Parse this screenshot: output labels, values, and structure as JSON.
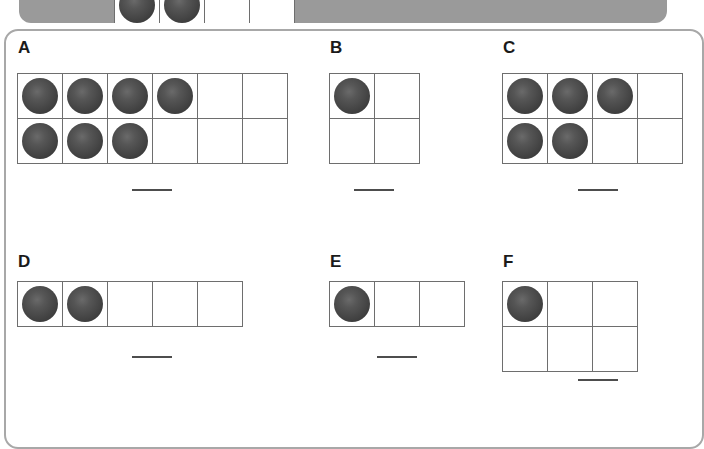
{
  "worksheet": {
    "title": "Counting Counters Worksheet",
    "counter_color": "#4a4a4a",
    "grid_line_color": "#6e6e6e",
    "panel_border_color": "#a8a8a8",
    "top_panel_color": "#9a9a9a"
  },
  "top_panel": {
    "label": "previous-question-strip",
    "grid": {
      "columns": 4,
      "rows": 1,
      "filled": 2
    }
  },
  "problems": [
    {
      "letter": "A",
      "columns": 6,
      "rows": 2,
      "cell_size": 45,
      "counts": [
        4,
        3
      ],
      "total_counters": 7,
      "answer": ""
    },
    {
      "letter": "B",
      "columns": 2,
      "rows": 2,
      "cell_size": 45,
      "counts": [
        1,
        0
      ],
      "total_counters": 1,
      "answer": ""
    },
    {
      "letter": "C",
      "columns": 4,
      "rows": 2,
      "cell_size": 45,
      "counts": [
        3,
        2
      ],
      "total_counters": 5,
      "answer": ""
    },
    {
      "letter": "D",
      "columns": 5,
      "rows": 1,
      "cell_size": 45,
      "counts": [
        2
      ],
      "total_counters": 2,
      "answer": ""
    },
    {
      "letter": "E",
      "columns": 3,
      "rows": 1,
      "cell_size": 45,
      "counts": [
        1
      ],
      "total_counters": 1,
      "answer": ""
    },
    {
      "letter": "F",
      "columns": 3,
      "rows": 2,
      "cell_size": 45,
      "counts": [
        1,
        0
      ],
      "total_counters": 1,
      "answer": ""
    }
  ]
}
